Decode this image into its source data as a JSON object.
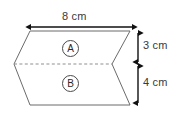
{
  "figure": {
    "type": "geometry-diagram",
    "background_color": "#ffffff",
    "stroke_color": "#6b6b6b",
    "arrow_color": "#111111",
    "dashed_color": "#8c8c8c",
    "text_color": "#3a3a3a",
    "dimensions": {
      "width_label": "8 cm",
      "upper_height_label": "3 cm",
      "lower_height_label": "4 cm"
    },
    "faces": [
      {
        "id": "A",
        "label": "A"
      },
      {
        "id": "B",
        "label": "B"
      }
    ],
    "geometry": {
      "top_left": [
        30,
        31
      ],
      "top_right": [
        130,
        31
      ],
      "bottom_right": [
        130,
        105
      ],
      "bottom_left": [
        30,
        105
      ],
      "left_apex": [
        14,
        64
      ],
      "right_notch": [
        112,
        64
      ],
      "dashed_line": [
        [
          14,
          64
        ],
        [
          112,
          64
        ]
      ],
      "width_arrow": {
        "x1": 30,
        "x2": 133,
        "y": 27
      },
      "upper_arrow": {
        "x": 138,
        "y1": 31,
        "y2": 64
      },
      "lower_arrow": {
        "x": 138,
        "y1": 64,
        "y2": 105
      }
    }
  }
}
